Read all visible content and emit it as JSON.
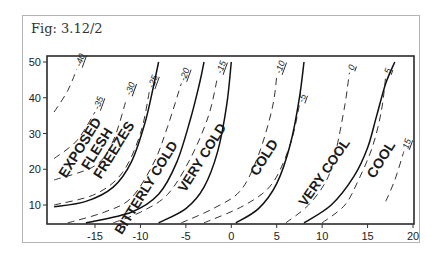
{
  "figure": {
    "label": "Fig: 3.12/2"
  },
  "chart_data": {
    "type": "line",
    "title": "Fig: 3.12/2",
    "subtitle": "",
    "xlabel": "",
    "ylabel": "",
    "xlim": [
      -19.5,
      20
    ],
    "ylim": [
      5,
      52
    ],
    "grid": false,
    "legend": "none",
    "x_ticks": [
      "-15",
      "-10",
      "-5",
      "0",
      "5",
      "10",
      "15",
      "20"
    ],
    "y_ticks": [
      "10",
      "20",
      "30",
      "40",
      "50"
    ],
    "zone_boundaries_solid": [
      {
        "name": "boundary-exposed-bitterly",
        "label": "-25",
        "points": [
          [
            -19.5,
            9.5
          ],
          [
            -16,
            11
          ],
          [
            -13,
            15
          ],
          [
            -11,
            22
          ],
          [
            -9.5,
            33
          ],
          [
            -8.5,
            44
          ],
          [
            -8,
            50
          ]
        ]
      },
      {
        "name": "boundary-bitterly-verycold",
        "label": "-20",
        "points": [
          [
            -16,
            5
          ],
          [
            -11,
            8
          ],
          [
            -8,
            13
          ],
          [
            -6,
            22
          ],
          [
            -4.5,
            34
          ],
          [
            -3.5,
            44
          ],
          [
            -3,
            50
          ]
        ]
      },
      {
        "name": "boundary-verycold-cold",
        "label": "-15",
        "points": [
          [
            -8,
            5
          ],
          [
            -5,
            9
          ],
          [
            -3,
            15
          ],
          [
            -1.5,
            25
          ],
          [
            -0.5,
            38
          ],
          [
            0,
            50
          ]
        ]
      },
      {
        "name": "boundary-cold-verycool",
        "label": "-10",
        "points": [
          [
            0.5,
            5
          ],
          [
            3,
            9
          ],
          [
            5,
            16
          ],
          [
            6.5,
            27
          ],
          [
            7.5,
            40
          ],
          [
            8,
            50
          ]
        ]
      },
      {
        "name": "boundary-verycool-cool",
        "label": "10",
        "points": [
          [
            8,
            5
          ],
          [
            11,
            10
          ],
          [
            13.5,
            18
          ],
          [
            15,
            26
          ],
          [
            16,
            35
          ],
          [
            17,
            44
          ],
          [
            18,
            50
          ]
        ]
      }
    ],
    "isotherms_dashed": [
      {
        "label": "-40",
        "points": [
          [
            -19.5,
            36
          ],
          [
            -18,
            42
          ],
          [
            -17,
            48
          ]
        ]
      },
      {
        "label": "-35",
        "points": [
          [
            -19.5,
            23
          ],
          [
            -17,
            28
          ],
          [
            -15,
            36
          ]
        ]
      },
      {
        "label": "-30",
        "points": [
          [
            -19.5,
            17
          ],
          [
            -15,
            21
          ],
          [
            -13,
            28
          ],
          [
            -11.5,
            40
          ]
        ]
      },
      {
        "label": "-25",
        "points": [
          [
            -19.5,
            10
          ],
          [
            -15,
            13
          ],
          [
            -12,
            19
          ],
          [
            -10,
            30
          ],
          [
            -9,
            42
          ]
        ]
      },
      {
        "label": "-20",
        "points": [
          [
            -18,
            5
          ],
          [
            -14,
            8
          ],
          [
            -11,
            12
          ],
          [
            -8.5,
            22
          ],
          [
            -7,
            32
          ],
          [
            -5.5,
            44
          ]
        ]
      },
      {
        "label": "-15",
        "points": [
          [
            -13,
            5
          ],
          [
            -10,
            8
          ],
          [
            -7,
            13
          ],
          [
            -4.5,
            23
          ],
          [
            -2.5,
            35
          ],
          [
            -1.5,
            46
          ]
        ]
      },
      {
        "label": "-10",
        "points": [
          [
            -5.5,
            5
          ],
          [
            -2,
            9
          ],
          [
            1,
            14
          ],
          [
            3,
            24
          ],
          [
            4.5,
            37
          ],
          [
            5,
            46
          ]
        ]
      },
      {
        "label": "-5",
        "points": [
          [
            -3,
            5
          ],
          [
            1.5,
            10
          ],
          [
            4.5,
            16
          ],
          [
            6.5,
            27
          ],
          [
            7.5,
            38
          ]
        ]
      },
      {
        "label": "0",
        "points": [
          [
            6,
            5
          ],
          [
            8.5,
            10
          ],
          [
            10.5,
            17
          ],
          [
            11.5,
            25
          ],
          [
            12.5,
            38
          ],
          [
            13,
            47
          ]
        ]
      },
      {
        "label": "5",
        "points": [
          [
            10,
            5
          ],
          [
            12.5,
            10
          ],
          [
            14,
            17
          ],
          [
            15.5,
            26
          ],
          [
            16.5,
            36
          ],
          [
            17,
            46
          ]
        ]
      },
      {
        "label": "15",
        "points": [
          [
            17,
            11
          ],
          [
            18,
            17
          ],
          [
            19,
            25
          ]
        ]
      }
    ],
    "zones": [
      {
        "label_lines": [
          "EXPOSED",
          "FLESH",
          "FREEZES"
        ]
      },
      {
        "label_lines": [
          "BITTERLY COLD"
        ]
      },
      {
        "label_lines": [
          "VERY COLD"
        ]
      },
      {
        "label_lines": [
          "COLD"
        ]
      },
      {
        "label_lines": [
          "VERY COOL"
        ]
      },
      {
        "label_lines": [
          "COOL"
        ]
      }
    ]
  }
}
